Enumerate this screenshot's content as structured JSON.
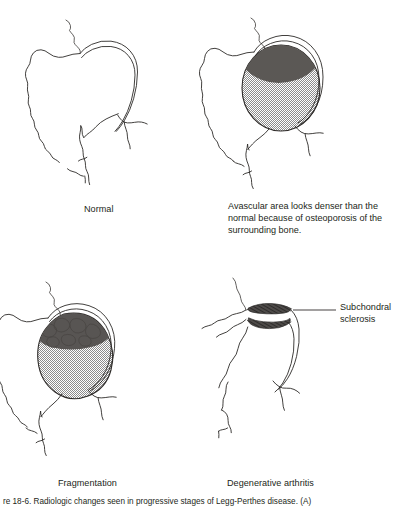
{
  "figure": {
    "title_text": "Legg-Perthes disease: radiographic stages of the hip",
    "caption": "re 18-6. Radiologic changes seen in progressive stages of Legg-Perthes disease. (A)",
    "panels": [
      {
        "id": "normal",
        "label": "Normal",
        "description": "Normal hip: rounded femoral head with smooth acetabular rim and preserved joint space.",
        "shading": "none"
      },
      {
        "id": "avascular",
        "label": "",
        "note": "Avascular area looks denser than the normal because of osteoporosis of the surrounding bone.",
        "description": "Femoral head uniformly stippled with a dark crescentic avascular segment at the superior pole.",
        "shading": "stipple-with-dark-crescent"
      },
      {
        "id": "fragmentation",
        "label": "Fragmentation",
        "description": "Flattened, stippled femoral head containing irregular light bone fragments separated by dark lucent lines in the superior portion.",
        "shading": "stipple-with-fragments"
      },
      {
        "id": "degenerative",
        "label": "Degenerative arthritis",
        "callout": "Subchondral sclerosis",
        "description": "Flattened femoral head with narrowed joint space and dense dark subchondral sclerotic bands on both acetabular and femoral surfaces.",
        "shading": "sclerotic-bands"
      }
    ],
    "colors": {
      "line": "#2d2a28",
      "text": "#231f20",
      "stipple_fill": "#9a9a9a",
      "dark_avascular": "#555252",
      "sclerosis": "#4d4a48",
      "background": "#ffffff"
    }
  }
}
